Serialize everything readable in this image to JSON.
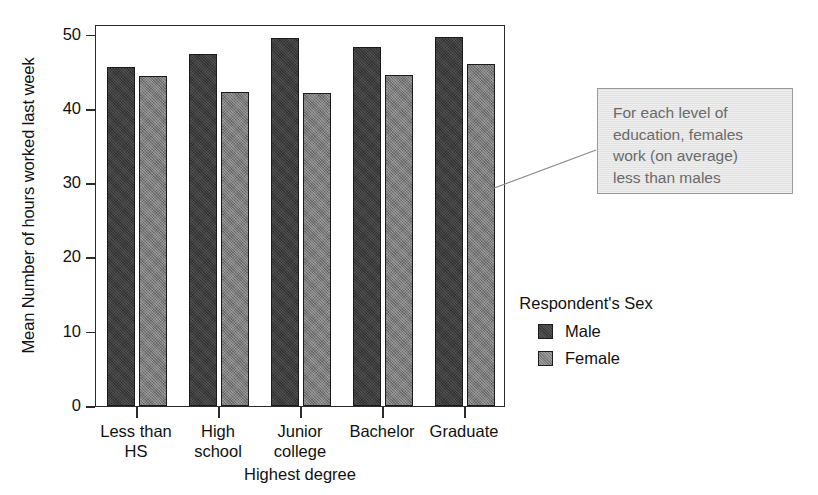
{
  "chart_data": {
    "type": "bar",
    "title": "",
    "xlabel": "Highest degree",
    "ylabel": "Mean Number of hours worked last week",
    "categories": [
      "Less than\nHS",
      "High\nschool",
      "Junior\ncollege",
      "Bachelor",
      "Graduate"
    ],
    "series": [
      {
        "name": "Male",
        "color": "#3c3c3c",
        "values": [
          45.6,
          47.4,
          49.5,
          48.3,
          49.6
        ]
      },
      {
        "name": "Female",
        "color": "#7b7b7b",
        "values": [
          44.4,
          42.3,
          42.1,
          44.6,
          46.0
        ]
      }
    ],
    "ylim": [
      0,
      52
    ],
    "yticks": [
      0,
      10,
      20,
      30,
      40,
      50
    ],
    "ytick_labels": [
      "0",
      "10",
      "20",
      "30",
      "40",
      "50"
    ],
    "grid": false,
    "legend_position": "right",
    "legend_title": "Respondent's\nSex",
    "annotations": [
      {
        "text": "For each level of\neducation, females\nwork (on average)\nless than males",
        "points_to": "female-bar-graduate"
      }
    ]
  },
  "legend": {
    "title": "Respondent's\nSex",
    "entries": [
      {
        "label": "Male"
      },
      {
        "label": "Female"
      }
    ]
  },
  "annotation": {
    "text": "For each level of\neducation, females\nwork (on average)\nless than males"
  },
  "axes": {
    "y_title": "Mean Number of hours worked last week",
    "x_title": "Highest degree",
    "y_tick_labels": [
      "50",
      "40",
      "30",
      "20",
      "10",
      "0"
    ],
    "x_tick_labels": [
      "Less than\nHS",
      "High\nschool",
      "Junior\ncollege",
      "Bachelor",
      "Graduate"
    ]
  },
  "top_crop": {
    "remnant": ""
  }
}
